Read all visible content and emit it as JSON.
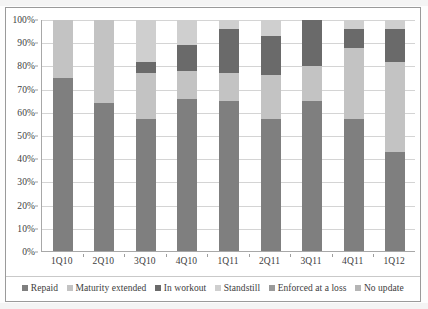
{
  "chart_data": {
    "type": "bar",
    "subtype": "100% stacked bar",
    "title": "",
    "xlabel": "",
    "ylabel": "",
    "ylim": [
      0,
      100
    ],
    "y_tick_labels": [
      "0%",
      "10%",
      "20%",
      "30%",
      "40%",
      "50%",
      "60%",
      "70%",
      "80%",
      "90%",
      "100%"
    ],
    "y_tick_values": [
      0,
      10,
      20,
      30,
      40,
      50,
      60,
      70,
      80,
      90,
      100
    ],
    "grid": true,
    "legend_position": "bottom",
    "categories": [
      "1Q10",
      "2Q10",
      "3Q10",
      "4Q10",
      "1Q11",
      "2Q11",
      "3Q11",
      "4Q11",
      "1Q12"
    ],
    "series": [
      {
        "name": "Repaid",
        "color": "#7f7f7f",
        "values": [
          75,
          64,
          57,
          66,
          65,
          57,
          65,
          57,
          43
        ]
      },
      {
        "name": "Maturity extended",
        "color": "#c3c3c3",
        "values": [
          25,
          36,
          20,
          12,
          12,
          19,
          15,
          31,
          39
        ]
      },
      {
        "name": "In workout",
        "color": "#6a6a6a",
        "values": [
          0,
          0,
          5,
          11,
          19,
          17,
          20,
          8,
          14
        ]
      },
      {
        "name": "Standstill",
        "color": "#cfcfcf",
        "values": [
          0,
          0,
          18,
          11,
          4,
          7,
          0,
          4,
          4
        ]
      },
      {
        "name": "Enforced at a loss",
        "color": "#9a9a9a",
        "values": [
          0,
          0,
          0,
          0,
          0,
          0,
          0,
          0,
          0
        ]
      },
      {
        "name": "No update",
        "color": "#b5b5b5",
        "values": [
          0,
          0,
          0,
          0,
          0,
          0,
          0,
          0,
          0
        ]
      }
    ]
  },
  "legend": {
    "items": [
      {
        "label": "Repaid"
      },
      {
        "label": "Maturity extended"
      },
      {
        "label": "In workout"
      },
      {
        "label": "Standstill"
      },
      {
        "label": "Enforced at a loss"
      },
      {
        "label": "No update"
      }
    ]
  }
}
